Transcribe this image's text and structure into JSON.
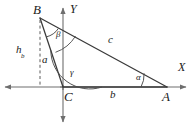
{
  "figure": {
    "kind": "geometry-diagram",
    "background_color": "#ffffff",
    "stroke_color": "#3a3a3a",
    "axis_color": "#6e6e6e",
    "text_color": "#1a1a1a",
    "axes": {
      "x_label": "X",
      "y_label": "Y",
      "origin_label": "C"
    },
    "vertices": [
      {
        "name": "B",
        "label": "B",
        "x": 40,
        "y": 18
      },
      {
        "name": "C",
        "label": "C",
        "x": 63,
        "y": 87
      },
      {
        "name": "A",
        "label": "A",
        "x": 167,
        "y": 87
      }
    ],
    "sides": [
      {
        "name": "side-a",
        "label": "a",
        "from": "B",
        "to": "C"
      },
      {
        "name": "side-b",
        "label": "b",
        "from": "C",
        "to": "A"
      },
      {
        "name": "side-c",
        "label": "c",
        "from": "B",
        "to": "A"
      }
    ],
    "angles": [
      {
        "name": "angle-alpha",
        "label": "α",
        "at": "A"
      },
      {
        "name": "angle-beta",
        "label": "β",
        "at": "B"
      },
      {
        "name": "angle-gamma",
        "label": "γ",
        "at": "C"
      }
    ],
    "altitude": {
      "name": "altitude-hb",
      "label": "h",
      "subscript": "b",
      "style": "dashed",
      "from": "B"
    }
  }
}
